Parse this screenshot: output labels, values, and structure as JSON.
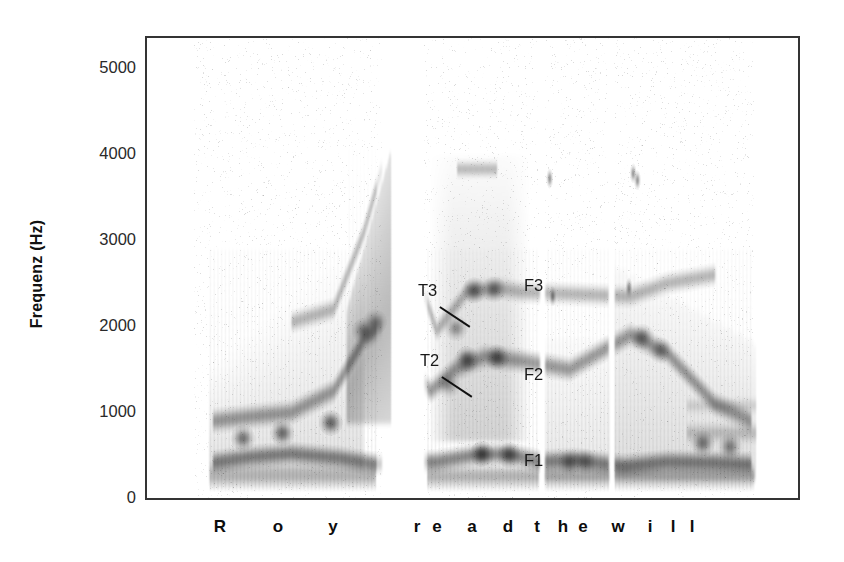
{
  "figure": {
    "title": "",
    "y_axis_label": "Frequenz (Hz)"
  },
  "axis": {
    "y_ticks": [
      {
        "label": "5000",
        "value": 5000
      },
      {
        "label": "4000",
        "value": 4000
      },
      {
        "label": "3000",
        "value": 3000
      },
      {
        "label": "2000",
        "value": 2000
      },
      {
        "label": "1000",
        "value": 1000
      },
      {
        "label": "0",
        "value": 0
      }
    ]
  },
  "annotations": [
    {
      "label": "T3",
      "x": 418,
      "y": 282,
      "leader": true
    },
    {
      "label": "T2",
      "x": 420,
      "y": 352,
      "leader": true
    },
    {
      "label": "F3",
      "x": 524,
      "y": 277,
      "leader": false
    },
    {
      "label": "F2",
      "x": 524,
      "y": 366,
      "leader": false
    },
    {
      "label": "F1",
      "x": 524,
      "y": 452,
      "leader": false
    }
  ],
  "phonemes": [
    {
      "label": "R",
      "x": 220
    },
    {
      "label": "o",
      "x": 278
    },
    {
      "label": "y",
      "x": 333
    },
    {
      "label": "r",
      "x": 417
    },
    {
      "label": "e",
      "x": 437
    },
    {
      "label": "a",
      "x": 472
    },
    {
      "label": "d",
      "x": 508
    },
    {
      "label": "t",
      "x": 537
    },
    {
      "label": "h",
      "x": 563
    },
    {
      "label": "e",
      "x": 583
    },
    {
      "label": "w",
      "x": 618
    },
    {
      "label": "i",
      "x": 650
    },
    {
      "label": "l",
      "x": 673
    },
    {
      "label": "l",
      "x": 692
    }
  ],
  "utterance": "Roy read the will",
  "chart_data": {
    "type": "heatmap",
    "title": "",
    "xlabel": "",
    "ylabel": "Frequenz (Hz)",
    "ylim": [
      0,
      5400
    ],
    "xlim": [
      0,
      1.0
    ],
    "grid": false,
    "legend": null,
    "y_tick_values": [
      0,
      1000,
      2000,
      3000,
      4000,
      5000
    ],
    "y_tick_labels": [
      "0",
      "1000",
      "2000",
      "3000",
      "4000",
      "5000"
    ],
    "phoneme_segments": [
      {
        "label": "R",
        "start": 0.045,
        "end": 0.12
      },
      {
        "label": "o",
        "start": 0.12,
        "end": 0.215
      },
      {
        "label": "y",
        "start": 0.215,
        "end": 0.32
      },
      {
        "label": "r",
        "start": 0.405,
        "end": 0.44
      },
      {
        "label": "e",
        "start": 0.44,
        "end": 0.5
      },
      {
        "label": "a",
        "start": 0.5,
        "end": 0.555
      },
      {
        "label": "d",
        "start": 0.555,
        "end": 0.59
      },
      {
        "label": "t",
        "start": 0.6,
        "end": 0.64
      },
      {
        "label": "h",
        "start": 0.64,
        "end": 0.672
      },
      {
        "label": "e",
        "start": 0.672,
        "end": 0.705
      },
      {
        "label": "w",
        "start": 0.715,
        "end": 0.775
      },
      {
        "label": "i",
        "start": 0.775,
        "end": 0.83
      },
      {
        "label": "l",
        "start": 0.83,
        "end": 0.88
      },
      {
        "label": "l",
        "start": 0.88,
        "end": 0.945
      }
    ],
    "formant_tracks": [
      {
        "name": "F1",
        "points_hz": [
          {
            "t": 0.05,
            "f": 420
          },
          {
            "t": 0.11,
            "f": 480
          },
          {
            "t": 0.18,
            "f": 520
          },
          {
            "t": 0.26,
            "f": 470
          },
          {
            "t": 0.32,
            "f": 400
          },
          {
            "t": 0.42,
            "f": 430
          },
          {
            "t": 0.48,
            "f": 500
          },
          {
            "t": 0.54,
            "f": 520
          },
          {
            "t": 0.59,
            "f": 430
          },
          {
            "t": 0.65,
            "f": 450
          },
          {
            "t": 0.73,
            "f": 380
          },
          {
            "t": 0.8,
            "f": 430
          },
          {
            "t": 0.88,
            "f": 420
          },
          {
            "t": 0.94,
            "f": 400
          }
        ]
      },
      {
        "name": "F2",
        "points_hz": [
          {
            "t": 0.05,
            "f": 900
          },
          {
            "t": 0.11,
            "f": 950
          },
          {
            "t": 0.18,
            "f": 1000
          },
          {
            "t": 0.25,
            "f": 1250
          },
          {
            "t": 0.3,
            "f": 1850
          },
          {
            "t": 0.33,
            "f": 2000
          },
          {
            "t": 0.41,
            "f": 1250
          },
          {
            "t": 0.45,
            "f": 1500
          },
          {
            "t": 0.5,
            "f": 1650
          },
          {
            "t": 0.56,
            "f": 1600
          },
          {
            "t": 0.64,
            "f": 1500
          },
          {
            "t": 0.74,
            "f": 1900
          },
          {
            "t": 0.8,
            "f": 1700
          },
          {
            "t": 0.88,
            "f": 1100
          },
          {
            "t": 0.94,
            "f": 900
          }
        ]
      },
      {
        "name": "F3",
        "points_hz": [
          {
            "t": 0.18,
            "f": 2050
          },
          {
            "t": 0.25,
            "f": 2200
          },
          {
            "t": 0.3,
            "f": 3100
          },
          {
            "t": 0.33,
            "f": 3850
          },
          {
            "t": 0.42,
            "f": 1950
          },
          {
            "t": 0.47,
            "f": 2400
          },
          {
            "t": 0.52,
            "f": 2450
          },
          {
            "t": 0.56,
            "f": 2400
          },
          {
            "t": 0.74,
            "f": 2350
          },
          {
            "t": 0.8,
            "f": 2500
          },
          {
            "t": 0.88,
            "f": 2600
          }
        ]
      }
    ],
    "transitions": [
      {
        "name": "T3",
        "t": 0.455,
        "f": 2050
      },
      {
        "name": "T2",
        "t": 0.435,
        "f": 1300
      }
    ],
    "silence_gaps": [
      {
        "start": 0.33,
        "end": 0.4
      },
      {
        "start": 0.59,
        "end": 0.6
      },
      {
        "start": 0.705,
        "end": 0.715
      },
      {
        "start": 0.945,
        "end": 1.0
      }
    ]
  }
}
